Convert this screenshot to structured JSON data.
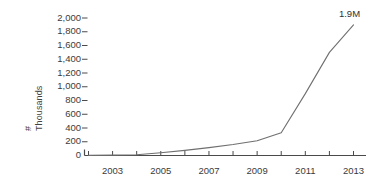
{
  "chart_data": {
    "type": "line",
    "title": "",
    "xlabel": "",
    "ylabel": "# Thousands",
    "ylabel_line1": "#",
    "ylabel_line2": "Thousands",
    "x": [
      2002,
      2003,
      2004,
      2005,
      2006,
      2007,
      2008,
      2009,
      2010,
      2011,
      2012,
      2013
    ],
    "values": [
      2,
      5,
      12,
      40,
      75,
      115,
      160,
      215,
      330,
      900,
      1500,
      1900
    ],
    "series": [
      {
        "name": "",
        "values": [
          2,
          5,
          12,
          40,
          75,
          115,
          160,
          215,
          330,
          900,
          1500,
          1900
        ]
      }
    ],
    "xlim": [
      2002,
      2013
    ],
    "ylim": [
      0,
      2000
    ],
    "ytick_values": [
      0,
      200,
      400,
      600,
      800,
      1000,
      1200,
      1400,
      1600,
      1800,
      2000
    ],
    "ytick_labels": [
      "0",
      "200",
      "400",
      "600",
      "800",
      "1,000",
      "1,200",
      "1,400",
      "1,600",
      "1,800",
      "2,000"
    ],
    "xtick_values": [
      2003,
      2005,
      2007,
      2009,
      2011,
      2013
    ],
    "xtick_labels": [
      "2003",
      "2005",
      "2007",
      "2009",
      "2011",
      "2013"
    ],
    "xtick_minor_values": [
      2002,
      2003,
      2004,
      2005,
      2006,
      2007,
      2008,
      2009,
      2010,
      2011,
      2012,
      2013
    ],
    "grid": false,
    "legend": false,
    "annotations": [
      {
        "text": "1.9M",
        "x": 2013,
        "y": 1900
      }
    ],
    "colors": {
      "line": "#6f6f6f",
      "axis": "#4a4a4a",
      "text": "#3b3b3b",
      "background": "#ffffff"
    }
  }
}
